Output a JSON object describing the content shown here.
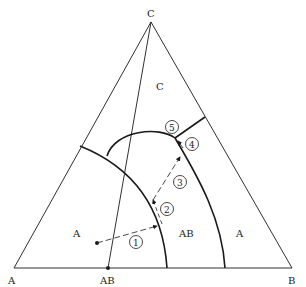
{
  "diagram": {
    "type": "ternary-phase-diagram",
    "vertices": {
      "top": "C",
      "left": "A",
      "right": "B"
    },
    "compound_on_base": "AB",
    "regions": [
      {
        "label": "C"
      },
      {
        "label": "A",
        "position": "left"
      },
      {
        "label": "AB"
      },
      {
        "label": "A",
        "position": "right"
      }
    ],
    "path_steps": [
      "1",
      "2",
      "3",
      "4",
      "5"
    ],
    "colors": {
      "line": "#1a1a1a",
      "background": "#ffffff"
    }
  }
}
